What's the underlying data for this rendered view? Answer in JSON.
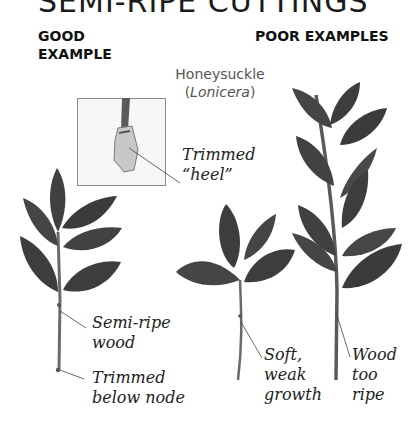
{
  "title": "SEMI-RIPE CUTTINGS",
  "headings": {
    "good": [
      "GOOD",
      "EXAMPLE"
    ],
    "poor": "POOR EXAMPLES"
  },
  "species": {
    "common_name": "Honeysuckle",
    "latin_name": "Lonicera",
    "paren_open": "(",
    "paren_close": ")"
  },
  "labels": {
    "heel": [
      "Trimmed",
      "“heel”"
    ],
    "semi_ripe": [
      "Semi-ripe",
      "wood"
    ],
    "trimmed_node": [
      "Trimmed",
      "below node"
    ],
    "soft": [
      "Soft,",
      "weak",
      "growth"
    ],
    "too_ripe": [
      "Wood",
      "too",
      "ripe"
    ]
  },
  "colors": {
    "leaf": "#3e3e3e",
    "leaf_light": "#5a5a5a",
    "stem": "#6a6a6a",
    "leader_line": "#444444",
    "inset_border": "#8a8a8a"
  }
}
